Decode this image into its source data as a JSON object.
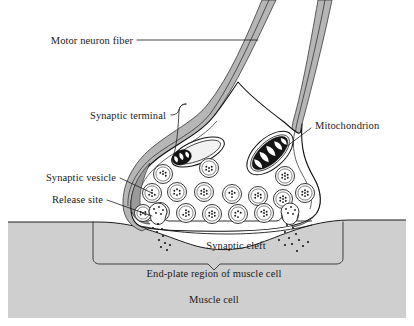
{
  "figure": {
    "width": 414,
    "height": 326,
    "background_color": "#ffffff"
  },
  "colors": {
    "outline": "#111111",
    "membrane_gray": "#b6b6b6",
    "muscle_gray": "#cfcfcf",
    "text": "#1a1a1a",
    "vesicle_fill": "#ffffff",
    "mitochondrion_cristae": "#151515"
  },
  "labels": {
    "motor_neuron_fiber": "Motor neuron fiber",
    "synaptic_terminal": "Synaptic terminal",
    "synaptic_vesicle": "Synaptic vesicle",
    "release_site": "Release site",
    "mitochondrion": "Mitochondrion",
    "synaptic_cleft": "Synaptic cleft",
    "end_plate_region": "End-plate region of muscle cell",
    "muscle_cell": "Muscle cell"
  },
  "structures": [
    {
      "name": "motor-neuron-fiber",
      "kind": "axon",
      "description": "Two parallel gray membrane bands descending diagonally from top right"
    },
    {
      "name": "synaptic-terminal",
      "kind": "bouton",
      "description": "Bulbous nerve ending containing vesicles and mitochondria"
    },
    {
      "name": "synaptic-vesicle",
      "kind": "vesicle",
      "count": 17,
      "description": "Double-ringed circles filled with neurotransmitter dots"
    },
    {
      "name": "mitochondrion-left",
      "kind": "organelle",
      "description": "Small elongated oval with dark cristae"
    },
    {
      "name": "mitochondrion-right",
      "kind": "organelle",
      "description": "Large tilted oval with dark folded cristae"
    },
    {
      "name": "release-site-left",
      "kind": "release-site",
      "description": "Vesicle fusing with terminal membrane releasing neurotransmitter"
    },
    {
      "name": "release-site-right",
      "kind": "release-site",
      "description": "Vesicle fusing with terminal membrane releasing neurotransmitter"
    },
    {
      "name": "synaptic-cleft",
      "kind": "gap",
      "description": "Space between terminal and muscle end-plate"
    },
    {
      "name": "end-plate-region",
      "kind": "muscle-region",
      "description": "Troughed muscle surface beneath terminal, marked by bracket"
    },
    {
      "name": "muscle-cell",
      "kind": "cell",
      "description": "Gray block forming lower portion of figure"
    }
  ],
  "vesicles": [
    {
      "cx": 163,
      "cy": 174,
      "r": 9.5
    },
    {
      "cx": 209,
      "cy": 168,
      "r": 9.5
    },
    {
      "cx": 285,
      "cy": 176,
      "r": 9.5
    },
    {
      "cx": 152,
      "cy": 193,
      "r": 9.5
    },
    {
      "cx": 177,
      "cy": 192,
      "r": 9.5
    },
    {
      "cx": 204,
      "cy": 192,
      "r": 9.5
    },
    {
      "cx": 232,
      "cy": 194,
      "r": 9.5
    },
    {
      "cx": 258,
      "cy": 196,
      "r": 9.5
    },
    {
      "cx": 283,
      "cy": 199,
      "r": 9.5
    },
    {
      "cx": 160,
      "cy": 212,
      "r": 9.5
    },
    {
      "cx": 186,
      "cy": 213,
      "r": 9.5
    },
    {
      "cx": 212,
      "cy": 214,
      "r": 9.5
    },
    {
      "cx": 238,
      "cy": 214,
      "r": 9.5
    },
    {
      "cx": 264,
      "cy": 213,
      "r": 9.5
    },
    {
      "cx": 305,
      "cy": 193,
      "r": 9.5
    },
    {
      "cx": 143,
      "cy": 213,
      "r": 8.5
    },
    {
      "cx": 290,
      "cy": 215,
      "r": 8.5
    }
  ],
  "label_positions": {
    "motor_neuron_fiber": {
      "x": 133,
      "y": 44
    },
    "synaptic_terminal": {
      "x": 166,
      "y": 119
    },
    "synaptic_vesicle": {
      "x": 116,
      "y": 181
    },
    "release_site": {
      "x": 103,
      "y": 203
    },
    "mitochondrion": {
      "x": 315,
      "y": 129
    },
    "synaptic_cleft": {
      "x": 236,
      "y": 249
    },
    "end_plate_region": {
      "x": 214,
      "y": 277
    },
    "muscle_cell": {
      "x": 214,
      "y": 303
    }
  }
}
